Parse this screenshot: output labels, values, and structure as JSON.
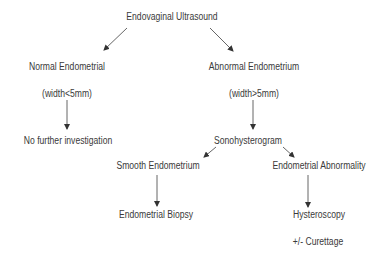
{
  "diagram": {
    "type": "flowchart",
    "colors": {
      "text": "#3a3a3a",
      "arrow": "#444444",
      "background": "#ffffff"
    },
    "nodes": {
      "root": {
        "label": "Endovaginal Ultrasound"
      },
      "normal": {
        "label": "Normal Endometrial"
      },
      "normal_width": {
        "label": "(width<5mm)"
      },
      "no_further": {
        "label": "No further investigation"
      },
      "abnormal": {
        "label": "Abnormal Endometrium"
      },
      "abnormal_width": {
        "label": "(width>5mm)"
      },
      "sono": {
        "label": "Sonohysterogram"
      },
      "smooth": {
        "label": "Smooth Endometrium"
      },
      "abnormality": {
        "label": "Endometrial Abnormality"
      },
      "biopsy": {
        "label": "Endometrial Biopsy"
      },
      "hysteroscopy": {
        "label": "Hysteroscopy"
      },
      "curettage": {
        "label": "+/- Curettage"
      }
    },
    "edges": [
      {
        "from": "root",
        "to": "normal"
      },
      {
        "from": "root",
        "to": "abnormal"
      },
      {
        "from": "normal",
        "to": "no_further"
      },
      {
        "from": "abnormal",
        "to": "sono"
      },
      {
        "from": "sono",
        "to": "smooth"
      },
      {
        "from": "sono",
        "to": "abnormality"
      },
      {
        "from": "smooth",
        "to": "biopsy"
      },
      {
        "from": "abnormality",
        "to": "hysteroscopy"
      }
    ]
  }
}
